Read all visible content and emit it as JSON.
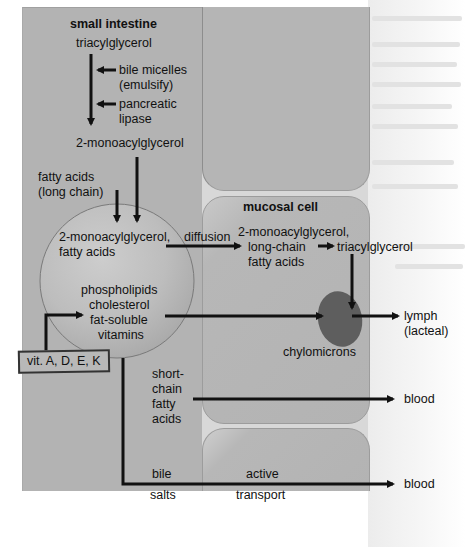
{
  "diagram": {
    "title": "small intestine",
    "regions": {
      "lumen_label": "small intestine",
      "cell_label": "mucosal cell"
    },
    "lumen_steps": {
      "substrate": "triacylglycerol",
      "agent_1": [
        "bile micelles",
        "(emulsify)"
      ],
      "agent_2": [
        "pancreatic",
        "lipase"
      ],
      "product": "2-monoacylglycerol",
      "fatty_acids": [
        "fatty acids",
        "(long chain)"
      ]
    },
    "micelle": {
      "top_text": [
        "2-monoacylglycerol,",
        "fatty acids"
      ],
      "bottom_text": [
        "phospholipids",
        "cholesterol",
        "fat-soluble",
        "vitamins"
      ]
    },
    "vitamins_box": "vit. A, D, E, K",
    "transport": {
      "diffusion_label": "diffusion",
      "cell_contents": [
        "2-monoacylglycerol,",
        "long-chain",
        "fatty acids"
      ],
      "resynthesized": "triacylglycerol",
      "chylomicrons_label": "chylomicrons",
      "lymph_destination": [
        "lymph",
        "(lacteal)"
      ],
      "short_chain": [
        "short-",
        "chain",
        "fatty",
        "acids"
      ],
      "short_chain_destination": "blood",
      "bile_salts": [
        "bile",
        "salts"
      ],
      "active_transport": [
        "active",
        "transport"
      ],
      "bile_destination": "blood"
    },
    "colors": {
      "lumen": "#b3b3b3",
      "cell": "#b5b5b5",
      "chylomicron": "#5a5a5a",
      "arrow": "#111111"
    }
  }
}
